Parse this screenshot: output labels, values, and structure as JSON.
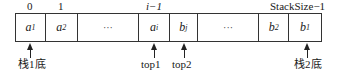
{
  "diagram": {
    "indices": [
      {
        "id": "idx-0",
        "text": "0"
      },
      {
        "id": "idx-1",
        "text": "1"
      },
      {
        "id": "idx-i-1",
        "text": "i−1"
      },
      {
        "id": "idx-stacksize-1",
        "text": "StackSize−1"
      }
    ],
    "cells": [
      {
        "base": "a",
        "sub": "1"
      },
      {
        "base": "a",
        "sub": "2"
      },
      {
        "base": "···",
        "sub": ""
      },
      {
        "base": "a",
        "sub": "i"
      },
      {
        "base": "b",
        "sub": "j"
      },
      {
        "base": "···",
        "sub": ""
      },
      {
        "base": "b",
        "sub": "2"
      },
      {
        "base": "b",
        "sub": "1"
      }
    ],
    "pointers": [
      {
        "label": "栈1底",
        "target_cell": 0
      },
      {
        "label": "top1",
        "target_cell": 3
      },
      {
        "label": "top2",
        "target_cell": 4
      },
      {
        "label": "栈2底",
        "target_cell": 7
      }
    ]
  }
}
